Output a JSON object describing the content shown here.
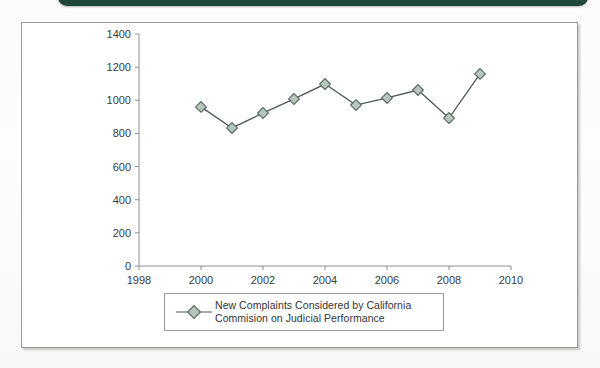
{
  "header": {
    "band_color": "#1f4738"
  },
  "figure": {
    "frame_color": "#9a9a9a",
    "background": "#ffffff"
  },
  "legend": {
    "line1": "New Complaints Considered by California",
    "line2": "Commision on Judicial Performance",
    "marker_fill": "#b6c6bc",
    "marker_stroke": "#53665c",
    "line_color": "#4a5a52"
  },
  "chart_data": {
    "type": "line",
    "title": "",
    "xlabel": "",
    "ylabel": "",
    "series": [
      {
        "name": "New Complaints Considered by California Commision on Judicial Performance",
        "x": [
          2000,
          2001,
          2002,
          2003,
          2004,
          2005,
          2006,
          2007,
          2008,
          2009
        ],
        "values": [
          960,
          833,
          923,
          1008,
          1098,
          971,
          1014,
          1062,
          893,
          1159
        ]
      }
    ],
    "x": [
      2000,
      2001,
      2002,
      2003,
      2004,
      2005,
      2006,
      2007,
      2008,
      2009
    ],
    "values": [
      960,
      833,
      923,
      1008,
      1098,
      971,
      1014,
      1062,
      893,
      1159
    ],
    "xlim": [
      1998,
      2010
    ],
    "ylim": [
      0,
      1400
    ],
    "xticks": [
      1998,
      2000,
      2002,
      2004,
      2006,
      2008,
      2010
    ],
    "xticklabels": [
      "1998",
      "2000",
      "2002",
      "2004",
      "2006",
      "2008",
      "2010"
    ],
    "yticks": [
      0,
      200,
      400,
      600,
      800,
      1000,
      1200,
      1400
    ],
    "yticklabels": [
      "0",
      "200",
      "400",
      "600",
      "800",
      "1000",
      "1200",
      "1400"
    ],
    "grid": false,
    "legend_position": "bottom-center",
    "marker": "diamond",
    "marker_fill": "#b6c6bc",
    "marker_stroke": "#53665c",
    "line_color": "#4a5a52",
    "axis_color": "#8f8f8f",
    "tick_label_color": "#3a3a3a"
  }
}
